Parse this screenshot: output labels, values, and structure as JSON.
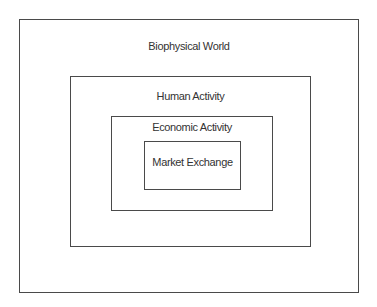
{
  "diagram": {
    "type": "nested-boxes",
    "layers": [
      {
        "id": "biophysical-world",
        "label": "Biophysical World",
        "box": {
          "left": 19,
          "top": 19,
          "right": 358,
          "bottom": 292
        },
        "label_center_y": 45
      },
      {
        "id": "human-activity",
        "label": "Human Activity",
        "box": {
          "left": 70,
          "top": 76,
          "right": 310,
          "bottom": 246
        },
        "label_center_y": 95
      },
      {
        "id": "economic-activity",
        "label": "Economic Activity",
        "box": {
          "left": 111,
          "top": 116,
          "right": 272,
          "bottom": 210
        },
        "label_center_y": 127
      },
      {
        "id": "market-exchange",
        "label": "Market Exchange",
        "box": {
          "left": 144,
          "top": 141,
          "right": 240,
          "bottom": 189
        },
        "label_center_y": 162
      }
    ],
    "colors": {
      "line": "#4a4a4a",
      "text": "#333333",
      "background": "#ffffff"
    }
  }
}
